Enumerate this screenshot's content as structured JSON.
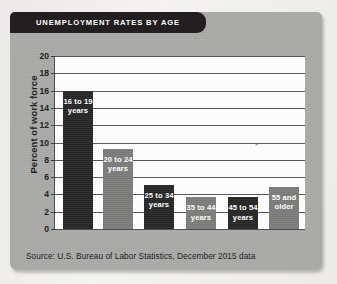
{
  "card": {
    "title": "UNEMPLOYMENT RATES BY AGE",
    "source": "Source: U.S. Bureau of Labor Statistics, December 2015 data"
  },
  "colors": {
    "card_background": "#a9a9a7",
    "title_bar": "#231f20",
    "plot_background": "#ffffff",
    "gridline": "#55565a",
    "bar_dark": "#262626",
    "bar_gray": "#7b7b79",
    "label_text": "#ffffff"
  },
  "chart_data": {
    "type": "bar",
    "title": "UNEMPLOYMENT RATES BY AGE",
    "xlabel": "",
    "ylabel": "Percent of work force",
    "ylim": [
      0,
      20
    ],
    "ytick_step": 2,
    "ytick_labels": [
      "0",
      "2",
      "4",
      "6",
      "8",
      "10",
      "12",
      "14",
      "16",
      "18",
      "20"
    ],
    "grid": true,
    "legend": "none",
    "source": "Source: U.S. Bureau of Labor Statistics, December 2015 data",
    "categories": [
      "16 to 19 years",
      "20 to 24 years",
      "25 to 34 years",
      "35 to 44 years",
      "45 to 54 years",
      "55 and older"
    ],
    "values": [
      16.0,
      9.3,
      5.1,
      3.7,
      3.7,
      4.9
    ],
    "bars": [
      {
        "label_line1": "16 to 19",
        "label_line2": "years",
        "value": 16.0,
        "color": "#262626",
        "shade": "dark"
      },
      {
        "label_line1": "20 to 24",
        "label_line2": "years",
        "value": 9.3,
        "color": "#7b7b79",
        "shade": "gray"
      },
      {
        "label_line1": "25 to 34",
        "label_line2": "years",
        "value": 5.1,
        "color": "#262626",
        "shade": "dark"
      },
      {
        "label_line1": "35 to 44",
        "label_line2": "years",
        "value": 3.7,
        "color": "#7b7b79",
        "shade": "gray"
      },
      {
        "label_line1": "45 to 54",
        "label_line2": "years",
        "value": 3.7,
        "color": "#262626",
        "shade": "dark"
      },
      {
        "label_line1": "55 and",
        "label_line2": "older",
        "value": 4.9,
        "color": "#7b7b79",
        "shade": "gray"
      }
    ]
  }
}
